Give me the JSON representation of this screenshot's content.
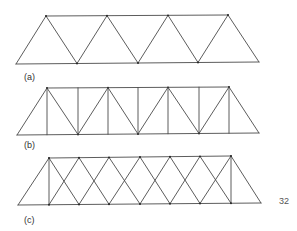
{
  "figure": {
    "stroke_color": "#4a4a4a",
    "stroke_width": 0.9,
    "page_number": "32",
    "trusses": [
      {
        "id": "a",
        "label": "(a)",
        "label_pos": [
          24,
          73
        ],
        "type": "warren",
        "top_chord": [
          [
            46,
            16
          ],
          [
            228,
            15
          ]
        ],
        "bottom_chord": [
          [
            16,
            64
          ],
          [
            259,
            62
          ]
        ],
        "top_nodes_x": [
          46,
          107,
          168,
          228
        ],
        "bottom_nodes_x": [
          16,
          77,
          138,
          198,
          259
        ],
        "verticals": false,
        "double_diagonals": false
      },
      {
        "id": "b",
        "label": "(b)",
        "label_pos": [
          24,
          141
        ],
        "type": "warren-with-verticals",
        "top_chord": [
          [
            47,
            88
          ],
          [
            229,
            87
          ]
        ],
        "bottom_chord": [
          [
            17,
            135
          ],
          [
            259,
            133
          ]
        ],
        "top_nodes_x": [
          47,
          108,
          168,
          229
        ],
        "bottom_nodes_x": [
          17,
          78,
          138,
          199,
          259
        ],
        "vertical_x": [
          47,
          78,
          108,
          138,
          168,
          199,
          229
        ],
        "verticals": true,
        "double_diagonals": false
      },
      {
        "id": "c",
        "label": "(c)",
        "label_pos": [
          24,
          216
        ],
        "type": "lattice-double-warren",
        "top_chord": [
          [
            49,
            158
          ],
          [
            231,
            156
          ]
        ],
        "bottom_chord": [
          [
            18,
            205
          ],
          [
            261,
            203
          ]
        ],
        "panel_x": [
          49,
          79,
          109,
          140,
          170,
          200,
          231
        ],
        "verticals_at_ends": true,
        "double_diagonals": true
      }
    ]
  }
}
